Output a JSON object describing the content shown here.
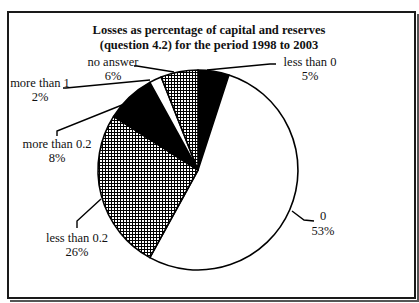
{
  "chart_data": {
    "type": "pie",
    "title": "Losses as percentage of capital and reserves (question 4.2) for the period 1998 to 2003",
    "title_lines": [
      "Losses as percentage of capital and reserves",
      "(question 4.2) for the period 1998 to 2003"
    ],
    "start_angle_deg": 0,
    "direction": "clockwise",
    "slices": [
      {
        "label": "less than 0",
        "value": 5,
        "display": "5%",
        "fill": "black"
      },
      {
        "label": "0",
        "value": 53,
        "display": "53%",
        "fill": "white"
      },
      {
        "label": "less than 0.2",
        "value": 26,
        "display": "26%",
        "fill": "crosshatch"
      },
      {
        "label": "more than 0.2",
        "value": 8,
        "display": "8%",
        "fill": "black"
      },
      {
        "label": "more than 1",
        "value": 2,
        "display": "2%",
        "fill": "white"
      },
      {
        "label": "no answer",
        "value": 6,
        "display": "6%",
        "fill": "crosshatch"
      }
    ],
    "legend": "none (labels with leader lines)",
    "colors": {
      "black": "#000000",
      "white": "#ffffff",
      "hatch_line": "#000000",
      "border": "#1a1a1a"
    }
  }
}
